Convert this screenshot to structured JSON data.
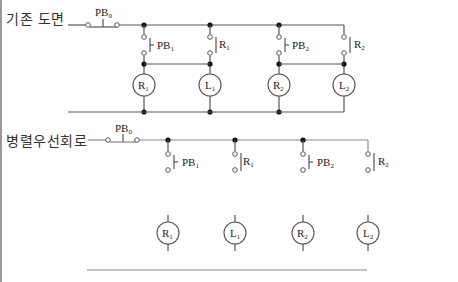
{
  "diagram": {
    "sections": [
      {
        "title": "기존 도면",
        "main_switch": {
          "label": "PB",
          "sub": "0"
        },
        "branches": [
          {
            "contact": {
              "type": "push-button",
              "label": "PB",
              "sub": "1"
            },
            "load": {
              "label": "R",
              "sub": "1"
            }
          },
          {
            "contact": {
              "type": "relay",
              "label": "R",
              "sub": "1"
            },
            "load": {
              "label": "L",
              "sub": "1"
            }
          },
          {
            "contact": {
              "type": "push-button",
              "label": "PB",
              "sub": "2"
            },
            "load": {
              "label": "R",
              "sub": "2"
            }
          },
          {
            "contact": {
              "type": "relay",
              "label": "R",
              "sub": "2"
            },
            "load": {
              "label": "L",
              "sub": "2"
            }
          }
        ]
      },
      {
        "title": "병렬우선회로",
        "main_switch": {
          "label": "PB",
          "sub": "0"
        },
        "branches": [
          {
            "contact": {
              "type": "push-button",
              "label": "PB",
              "sub": "1"
            },
            "load": {
              "label": "R",
              "sub": "1"
            }
          },
          {
            "contact": {
              "type": "relay",
              "label": "R",
              "sub": "1"
            },
            "load": {
              "label": "L",
              "sub": "1"
            }
          },
          {
            "contact": {
              "type": "push-button",
              "label": "PB",
              "sub": "2"
            },
            "load": {
              "label": "R",
              "sub": "2"
            }
          },
          {
            "contact": {
              "type": "relay",
              "label": "R",
              "sub": "2"
            },
            "load": {
              "label": "L",
              "sub": "2"
            }
          }
        ]
      }
    ]
  }
}
